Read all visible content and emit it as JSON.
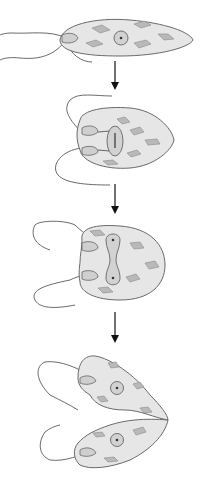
{
  "diagram": {
    "stages": [
      {
        "id": 1,
        "label": "Single Euglena cell with one flagellum, nucleus and chloroplasts"
      },
      {
        "id": 2,
        "label": "Flagellum and gullet duplicate, nucleus begins dividing"
      },
      {
        "id": 3,
        "label": "Nucleus divides into two connected nuclei"
      },
      {
        "id": 4,
        "label": "Cell splits longitudinally into two daughter cells"
      }
    ],
    "arrows": 3,
    "colors": {
      "cell_fill": "#e6e6e6",
      "cell_outline": "#6a6a6a",
      "chloroplast": "#b9b9b9",
      "nucleus": "#d2d2d2",
      "arrow": "#111111",
      "background": "#ffffff"
    }
  }
}
